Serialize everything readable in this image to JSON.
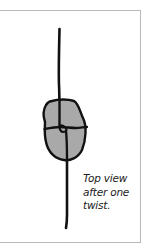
{
  "figure": {
    "caption_lines": [
      "Top view",
      "after one",
      "twist."
    ],
    "colors": {
      "stroke": "#111111",
      "fill": "#a9a9a9",
      "frame": "#b8b8b8",
      "background": "#ffffff"
    },
    "elements": [
      {
        "name": "upper-stem",
        "description": "vertical line above blob"
      },
      {
        "name": "twisted-blob",
        "description": "grey rounded shape with cross creases"
      },
      {
        "name": "lower-stem",
        "description": "vertical line below blob"
      }
    ]
  }
}
